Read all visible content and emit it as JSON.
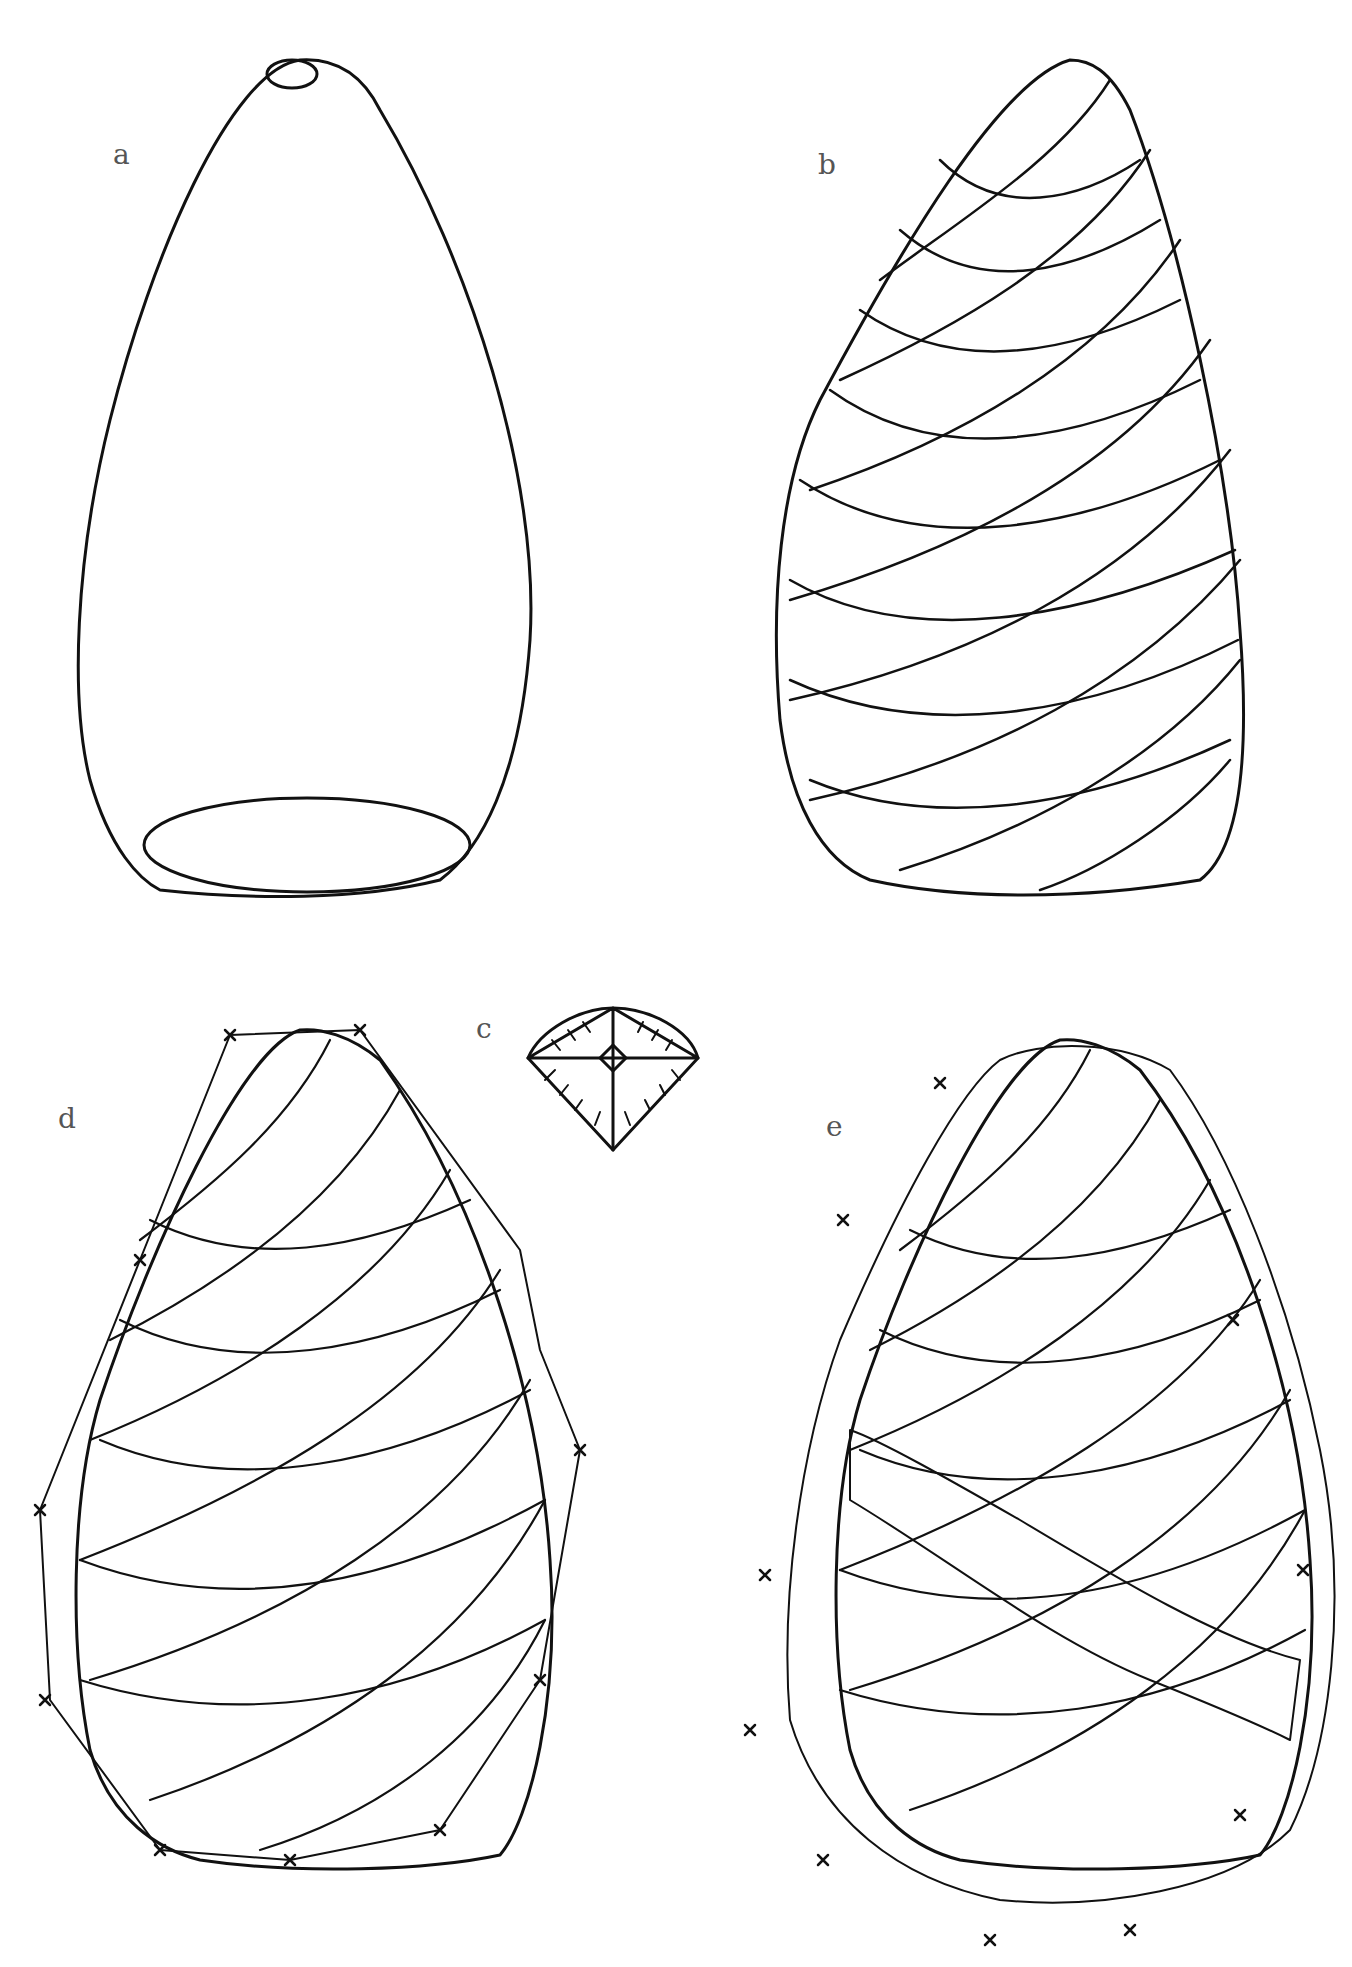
{
  "figure": {
    "panels": [
      {
        "id": "a",
        "label": "a",
        "description": "Plain egg/cone-shaped form with open top and bottom ellipses"
      },
      {
        "id": "b",
        "label": "b",
        "description": "Cone form covered with crossing spiral grid lines"
      },
      {
        "id": "c",
        "label": "c",
        "description": "Single diamond-shaped cell detail with radial hatching"
      },
      {
        "id": "d",
        "label": "d",
        "description": "Spiral grid with a band of hatched cells and outer contour marked by crosses"
      },
      {
        "id": "e",
        "label": "e",
        "description": "Spiral grid with textured scale band and irregular outer contour marked by crosses"
      }
    ],
    "colors": {
      "ink": "#111111",
      "label": "#555555",
      "background": "#ffffff"
    }
  }
}
